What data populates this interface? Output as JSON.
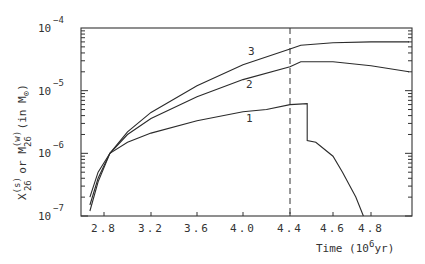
{
  "chart_data": {
    "type": "line",
    "title": "",
    "xlabel": "Time (10^6 yr)",
    "ylabel": "X_26^(s) or M_26^(w) (in M_⊙)",
    "yscale": "log",
    "xlim": [
      2.6,
      5.27
    ],
    "ylim": [
      1e-07,
      0.0001
    ],
    "x_ticks": [
      "2.8",
      "3.2",
      "3.6",
      "4.0",
      "4.4",
      "4.6",
      "4.8"
    ],
    "y_ticks": [
      "10^-7",
      "10^-6",
      "10^-5",
      "10^-4"
    ],
    "grid": false,
    "legend": "inline curve labels 1, 2, 3",
    "annotations": [
      {
        "type": "vertical-dashed-line",
        "x": 4.4
      }
    ],
    "series": [
      {
        "name": "3",
        "points": [
          [
            2.68,
            1.5e-07
          ],
          [
            2.75,
            4e-07
          ],
          [
            2.85,
            1e-06
          ],
          [
            3.0,
            2.2e-06
          ],
          [
            3.2,
            4.5e-06
          ],
          [
            3.6,
            1.2e-05
          ],
          [
            4.0,
            2.6e-05
          ],
          [
            4.4,
            4.6e-05
          ],
          [
            4.45,
            5.3e-05
          ],
          [
            4.6,
            5.8e-05
          ],
          [
            4.8,
            6e-05
          ],
          [
            5.0,
            6e-05
          ]
        ]
      },
      {
        "name": "2",
        "points": [
          [
            2.68,
            1.2e-07
          ],
          [
            2.75,
            3.5e-07
          ],
          [
            2.85,
            1e-06
          ],
          [
            3.0,
            2e-06
          ],
          [
            3.2,
            3.6e-06
          ],
          [
            3.6,
            8e-06
          ],
          [
            4.0,
            1.5e-05
          ],
          [
            4.4,
            2.4e-05
          ],
          [
            4.45,
            2.9e-05
          ],
          [
            4.6,
            2.9e-05
          ],
          [
            4.8,
            2.5e-05
          ],
          [
            5.0,
            2e-05
          ]
        ]
      },
      {
        "name": "1",
        "points": [
          [
            2.68,
            2e-07
          ],
          [
            2.75,
            5e-07
          ],
          [
            2.85,
            1e-06
          ],
          [
            3.0,
            1.5e-06
          ],
          [
            3.2,
            2.1e-06
          ],
          [
            3.6,
            3.3e-06
          ],
          [
            4.0,
            4.6e-06
          ],
          [
            4.2,
            5e-06
          ],
          [
            4.4,
            6e-06
          ],
          [
            4.48,
            6.2e-06
          ],
          [
            4.48,
            1.6e-06
          ],
          [
            4.52,
            1.5e-06
          ],
          [
            4.6,
            9e-07
          ],
          [
            4.65,
            5e-07
          ],
          [
            4.72,
            2e-07
          ],
          [
            4.76,
            1e-07
          ]
        ]
      }
    ]
  },
  "axes": {
    "x_label_prefix": "Time (10",
    "x_label_exp": "6",
    "x_label_suffix": "yr)",
    "y_label": "X(s)26 or M(w)26 (in M⊙)"
  }
}
